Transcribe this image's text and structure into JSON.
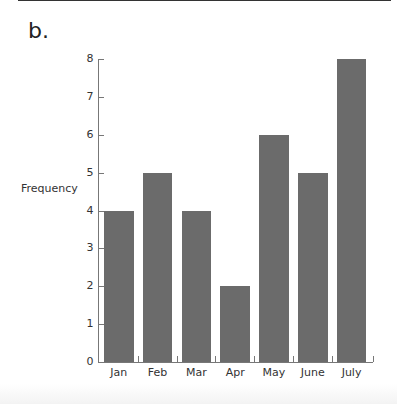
{
  "part_label": "b.",
  "chart_data": {
    "type": "bar",
    "title": "",
    "xlabel": "",
    "ylabel": "Frequency",
    "categories": [
      "Jan",
      "Feb",
      "Mar",
      "Apr",
      "May",
      "June",
      "July"
    ],
    "values": [
      4,
      5,
      4,
      2,
      6,
      5,
      8
    ],
    "yticks": [
      0,
      1,
      2,
      3,
      4,
      5,
      6,
      7,
      8
    ],
    "ylim": [
      0,
      8
    ],
    "grid": false,
    "legend": null,
    "bar_color": "#6b6b6b"
  }
}
